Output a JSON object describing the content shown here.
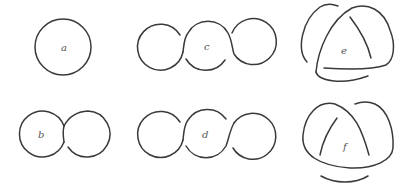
{
  "figure": {
    "stroke_color": "#3a3a3a",
    "label_color": "#555555",
    "panels": [
      {
        "id": "a",
        "label": "a",
        "kind": "unknot (single circle)"
      },
      {
        "id": "b",
        "label": "b",
        "kind": "unknot with one twist (two loops)"
      },
      {
        "id": "c",
        "label": "c",
        "kind": "three loops chain, two crossings"
      },
      {
        "id": "d",
        "label": "d",
        "kind": "three loops chain, two crossings"
      },
      {
        "id": "e",
        "label": "e",
        "kind": "trefoil-like diagram"
      },
      {
        "id": "f",
        "label": "f",
        "kind": "trefoil-like diagram"
      }
    ]
  }
}
